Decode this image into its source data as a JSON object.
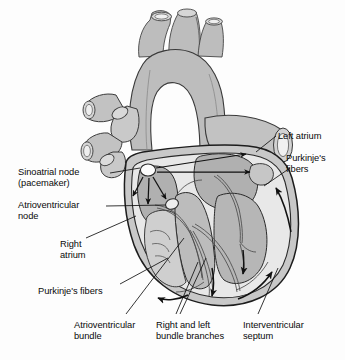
{
  "figure": {
    "background_color": "#fdfdfd",
    "line_color": "#111111",
    "fill_mid": "#b4b4b4",
    "fill_light": "#d9d9d9",
    "fill_pale": "#ececec",
    "fill_white": "#f7f7f7"
  },
  "labels": [
    {
      "id": "left-atrium",
      "text": "Left atrium",
      "x": 278,
      "y": 131,
      "align": "left"
    },
    {
      "id": "purkinje-right",
      "text": "Purkinje's\nfibers",
      "x": 286,
      "y": 153,
      "align": "left"
    },
    {
      "id": "sinoatrial-node",
      "text": "Sinoatrial node\n(pacemaker)",
      "x": 18,
      "y": 167,
      "align": "left"
    },
    {
      "id": "atrioventricular-node",
      "text": "Atrioventricular\nnode",
      "x": 18,
      "y": 200,
      "align": "left"
    },
    {
      "id": "right-atrium",
      "text": "Right\natrium",
      "x": 60,
      "y": 239,
      "align": "left"
    },
    {
      "id": "purkinje-left",
      "text": "Purkinje's fibers",
      "x": 38,
      "y": 286,
      "align": "left"
    },
    {
      "id": "atrioventricular-bundle",
      "text": "Atrioventricular\nbundle",
      "x": 74,
      "y": 320,
      "align": "left"
    },
    {
      "id": "bundle-branches",
      "text": "Right and left\nbundle branches",
      "x": 156,
      "y": 320,
      "align": "left"
    },
    {
      "id": "interventricular-septum",
      "text": "Interventricular\nseptum",
      "x": 243,
      "y": 320,
      "align": "left"
    }
  ]
}
